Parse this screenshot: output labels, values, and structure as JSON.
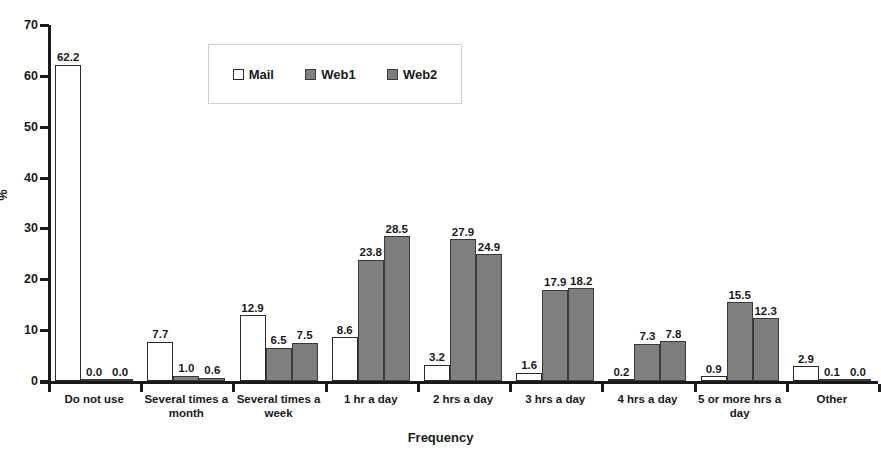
{
  "chart_data": {
    "type": "bar",
    "title": "",
    "xlabel": "Frequency",
    "ylabel": "%",
    "ylim": [
      0,
      70
    ],
    "yticks": [
      0,
      10,
      20,
      30,
      40,
      50,
      60,
      70
    ],
    "grid": false,
    "legend_position": "top-center",
    "categories": [
      "Do not use",
      "Several times a month",
      "Several times a week",
      "1 hr a day",
      "2 hrs a day",
      "3 hrs a day",
      "4 hrs a day",
      "5 or more hrs a day",
      "Other"
    ],
    "series": [
      {
        "name": "Mail",
        "color": "#ffffff",
        "values": [
          62.2,
          7.7,
          12.9,
          8.6,
          3.2,
          1.6,
          0.2,
          0.9,
          2.9
        ],
        "labels": [
          "62.2",
          "7.7",
          "12.9",
          "8.6",
          "3.2",
          "1.6",
          "0.2",
          "0.9",
          "2.9"
        ]
      },
      {
        "name": "Web1",
        "color": "#808080",
        "values": [
          0.0,
          1.0,
          6.5,
          23.8,
          27.9,
          17.9,
          7.3,
          15.5,
          0.1
        ],
        "labels": [
          "0.0",
          "1.0",
          "6.5",
          "23.8",
          "27.9",
          "17.9",
          "7.3",
          "15.5",
          "0.1"
        ]
      },
      {
        "name": "Web2",
        "color": "#7d7d7d",
        "values": [
          0.0,
          0.6,
          7.5,
          28.5,
          24.9,
          18.2,
          7.8,
          12.3,
          0.0
        ],
        "labels": [
          "0.0",
          "0.6",
          "7.5",
          "28.5",
          "24.9",
          "18.2",
          "7.8",
          "12.3",
          "0.0"
        ]
      }
    ]
  },
  "axis": {
    "y_tick_labels": [
      "70",
      "60",
      "50",
      "40",
      "30",
      "20",
      "10",
      "0"
    ],
    "y_title": "%",
    "x_title": "Frequency"
  },
  "legend": {
    "items": [
      {
        "label": "Mail",
        "swatch": "mail"
      },
      {
        "label": "Web1",
        "swatch": "web1"
      },
      {
        "label": "Web2",
        "swatch": "web2"
      }
    ]
  }
}
